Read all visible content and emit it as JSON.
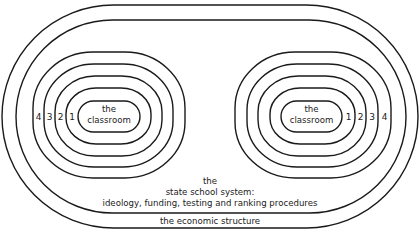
{
  "diagram": {
    "outer_layer": {
      "label": "the economic structure"
    },
    "middle_layer": {
      "label_lines": [
        "the",
        "state school system:",
        "ideology, funding, testing and ranking procedures"
      ]
    },
    "groups": [
      {
        "side": "left",
        "core_label_lines": [
          "the",
          "classroom"
        ],
        "ring_numbers": [
          "1",
          "2",
          "3",
          "4"
        ]
      },
      {
        "side": "right",
        "core_label_lines": [
          "the",
          "classroom"
        ],
        "ring_numbers": [
          "1",
          "2",
          "3",
          "4"
        ]
      }
    ],
    "line_color": "#1a1a1a",
    "text_color": "#222222"
  }
}
